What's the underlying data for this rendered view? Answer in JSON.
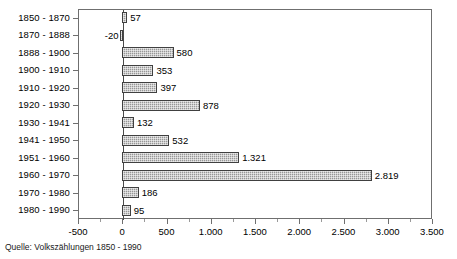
{
  "chart_data": {
    "type": "bar",
    "orientation": "horizontal",
    "title": "",
    "subtitle": "",
    "xlabel": "",
    "ylabel": "",
    "categories": [
      "1850 - 1870",
      "1870 - 1888",
      "1888 - 1900",
      "1900 - 1910",
      "1910 - 1920",
      "1920 - 1930",
      "1930 - 1941",
      "1941 - 1950",
      "1951 - 1960",
      "1960 - 1970",
      "1970 - 1980",
      "1980 - 1990"
    ],
    "values": [
      57,
      -20,
      580,
      353,
      397,
      878,
      132,
      532,
      1321,
      2819,
      186,
      95
    ],
    "value_labels": [
      "57",
      "-20",
      "580",
      "353",
      "397",
      "878",
      "132",
      "532",
      "1.321",
      "2.819",
      "186",
      "95"
    ],
    "xlim": [
      -500,
      3500
    ],
    "xticks": [
      -500,
      0,
      500,
      1000,
      1500,
      2000,
      2500,
      3000,
      3500
    ],
    "xtick_labels": [
      "-500",
      "0",
      "500",
      "1.000",
      "1.500",
      "2.000",
      "2.500",
      "3.000",
      "3.500"
    ],
    "xtick_step": 500,
    "grid": false,
    "legend": false,
    "legend_position": "none",
    "bar_fill_color": "#a8a8a8",
    "bar_border_color": "#404040",
    "axis_color": "#6f6f6f",
    "background_color": "#ffffff",
    "number_format": "de-DE thousands separator '.'"
  },
  "footer": {
    "source_note": "Quelle: Volkszählungen 1850 - 1990"
  }
}
